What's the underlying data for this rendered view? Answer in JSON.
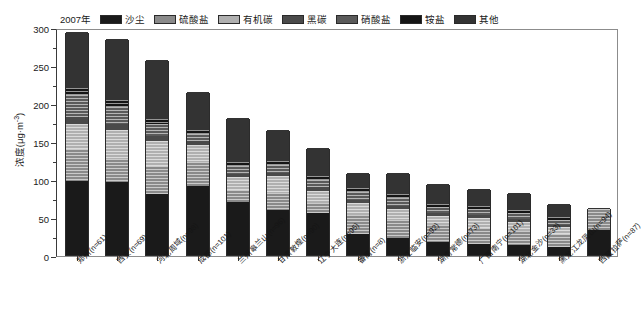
{
  "legend": {
    "year": "2007年",
    "items": [
      {
        "label": "沙尘",
        "color": "#1a1a1a",
        "hatch": false
      },
      {
        "label": "硫酸盐",
        "color": "#8a8a8a",
        "hatch": true
      },
      {
        "label": "有机碳",
        "color": "#b0b0b0",
        "hatch": true
      },
      {
        "label": "黑碳",
        "color": "#4a4a4a",
        "hatch": false
      },
      {
        "label": "硝酸盐",
        "color": "#5a5a5a",
        "hatch": true
      },
      {
        "label": "铵盐",
        "color": "#151515",
        "hatch": true
      },
      {
        "label": "其他",
        "color": "#333333",
        "hatch": false
      }
    ]
  },
  "axes": {
    "y_title": "浓度(μg·m⁻³)",
    "y_ticks": [
      0,
      50,
      100,
      150,
      200,
      250,
      300
    ],
    "y_minor_step": 25,
    "ylim": [
      0,
      300
    ]
  },
  "chart_data": {
    "type": "bar",
    "stacked": true,
    "title": "",
    "xlabel": "",
    "ylabel": "浓度(μg·m⁻³)",
    "ylim": [
      0,
      300
    ],
    "grid": false,
    "legend_position": "top",
    "legend_entries": [
      "沙尘",
      "硫酸盐",
      "有机碳",
      "黑碳",
      "硝酸盐",
      "铵盐",
      "其他"
    ],
    "annotations": [
      "2007年"
    ],
    "categories": [
      "郑州(n=61)",
      "西安(n=69)",
      "河北周域(n=98)",
      "成都(n=101)",
      "兰州皋兰山(n=96)",
      "甘肃敦煌(n=90)",
      "辽宁大连(n=95)",
      "番禺(n=8)",
      "浙江临安(n=92)",
      "湖南常德(n=73)",
      "广西南宁(n=101)",
      "湖北金沙(n=33)",
      "黑龙江龙凤山(n=94)",
      "西藏拉萨(n=87)"
    ],
    "tick_labels": [
      "郑州(n=61)",
      "西安(n=69)",
      "河北周域(n=98)",
      "成都(n=101)",
      "兰州皋兰山(n=96)",
      "甘肃敦煌(n=90)",
      "辽宁大连(n=95)",
      "番禺(n=8)",
      "浙江临安(n=92)",
      "湖南常德(n=73)",
      "广西南宁(n=101)",
      "湖北金沙(n=33)",
      "黑龙江龙凤山(n=94)",
      "西藏拉萨(n=87)"
    ],
    "series": [
      {
        "name": "沙尘",
        "values": [
          97,
          96,
          80,
          91,
          70,
          59,
          55,
          27,
          22,
          17,
          15,
          13,
          11,
          33
        ]
      },
      {
        "name": "硫酸盐",
        "values": [
          42,
          30,
          37,
          31,
          16,
          23,
          13,
          26,
          24,
          22,
          20,
          19,
          16,
          27
        ]
      },
      {
        "name": "有机碳",
        "values": [
          33,
          38,
          33,
          23,
          17,
          22,
          16,
          15,
          14,
          12,
          14,
          12,
          10,
          0
        ]
      },
      {
        "name": "黑碳",
        "values": [
          10,
          8,
          7,
          5,
          4,
          4,
          5,
          5,
          5,
          4,
          4,
          4,
          3,
          0
        ]
      },
      {
        "name": "硝酸盐",
        "values": [
          28,
          23,
          15,
          9,
          10,
          10,
          10,
          10,
          10,
          8,
          8,
          7,
          6,
          0
        ]
      },
      {
        "name": "铵盐",
        "values": [
          10,
          9,
          7,
          5,
          6,
          6,
          5,
          5,
          5,
          4,
          4,
          4,
          4,
          0
        ]
      },
      {
        "name": "其他",
        "values": [
          73,
          80,
          77,
          51,
          57,
          41,
          37,
          20,
          28,
          27,
          22,
          23,
          17,
          2
        ]
      }
    ],
    "totals": [
      293,
      284,
      256,
      215,
      180,
      165,
      141,
      108,
      108,
      94,
      87,
      82,
      67,
      62
    ]
  }
}
